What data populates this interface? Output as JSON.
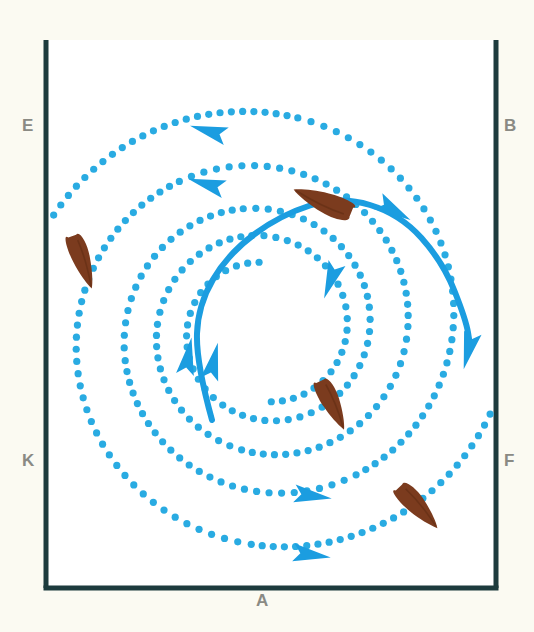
{
  "figure": {
    "background_color": "#fbfaf2",
    "panel_color": "#ffffff"
  },
  "frame": {
    "border_color": "#1d3b3d",
    "border_width": 5,
    "left_x": 46,
    "right_x": 496,
    "bottom_y": 588,
    "top_y": 40,
    "top_open": true
  },
  "labels": {
    "top_left": "E",
    "top_right": "B",
    "bottom_left": "K",
    "bottom_right": "F",
    "bottom_center": "A",
    "color": "#8a8a84"
  },
  "colors": {
    "dotted_spiral": "#29ABE2",
    "solid_path": "#1B9DE0",
    "arrow": "#1B9DE0",
    "organism_body": "#7B3B1E",
    "organism_shade": "#5E2C13",
    "frame": "#1d3b3d"
  },
  "chart_data": {
    "type": "scatter",
    "xlabel": "",
    "ylabel": "",
    "xlim": [
      46,
      496
    ],
    "ylim": [
      40,
      588
    ],
    "grid": false,
    "legend": "none",
    "spiral": {
      "center_x": 265,
      "center_y": 330,
      "direction": "counterclockwise",
      "turns": 2.6,
      "inner_radius": 68,
      "outer_radius": 250,
      "dot_radius": 3.6,
      "dot_spacing_px": 11
    },
    "series": [
      {
        "name": "dotted-spiral-arm-1",
        "style": "dotted",
        "start_angle_deg": 95,
        "end_angle_deg": 900,
        "r_start": 68,
        "r_end": 252
      },
      {
        "name": "dotted-spiral-arm-2",
        "style": "dotted",
        "start_angle_deg": 275,
        "end_angle_deg": 1080,
        "r_start": 72,
        "r_end": 248
      },
      {
        "name": "solid-trajectory",
        "style": "solid",
        "stroke_width": 6,
        "points": [
          [
            212,
            420
          ],
          [
            196,
            362
          ],
          [
            198,
            305
          ],
          [
            228,
            254
          ],
          [
            280,
            215
          ],
          [
            340,
            196
          ],
          [
            400,
            214
          ],
          [
            443,
            262
          ],
          [
            466,
            320
          ],
          [
            470,
            345
          ]
        ]
      }
    ],
    "arrows": [
      {
        "name": "arrow-outer-top",
        "x": 215,
        "y": 133,
        "angle_deg": 196
      },
      {
        "name": "arrow-mid-top",
        "x": 213,
        "y": 186,
        "angle_deg": 196
      },
      {
        "name": "arrow-inner-right",
        "x": 333,
        "y": 274,
        "angle_deg": 110
      },
      {
        "name": "arrow-core-left",
        "x": 187,
        "y": 363,
        "angle_deg": 280
      },
      {
        "name": "arrow-core-up",
        "x": 212,
        "y": 368,
        "angle_deg": 283
      },
      {
        "name": "arrow-mid-bottom",
        "x": 306,
        "y": 495,
        "angle_deg": 8
      },
      {
        "name": "arrow-outer-bottom",
        "x": 305,
        "y": 554,
        "angle_deg": 8
      },
      {
        "name": "arrow-solid-upper",
        "x": 388,
        "y": 207,
        "angle_deg": 30
      },
      {
        "name": "arrow-solid-end",
        "x": 470,
        "y": 344,
        "angle_deg": 104
      }
    ],
    "organisms": [
      {
        "name": "organism-upper-center",
        "x": 322,
        "y": 202,
        "angle_deg": 22,
        "length": 62,
        "width": 21
      },
      {
        "name": "organism-left",
        "x": 83,
        "y": 262,
        "angle_deg": 250,
        "length": 56,
        "width": 18
      },
      {
        "name": "organism-center-low",
        "x": 333,
        "y": 405,
        "angle_deg": 244,
        "length": 54,
        "width": 18
      },
      {
        "name": "organism-lower-right",
        "x": 419,
        "y": 507,
        "angle_deg": 227,
        "length": 56,
        "width": 19
      }
    ],
    "organism_count": 4
  }
}
